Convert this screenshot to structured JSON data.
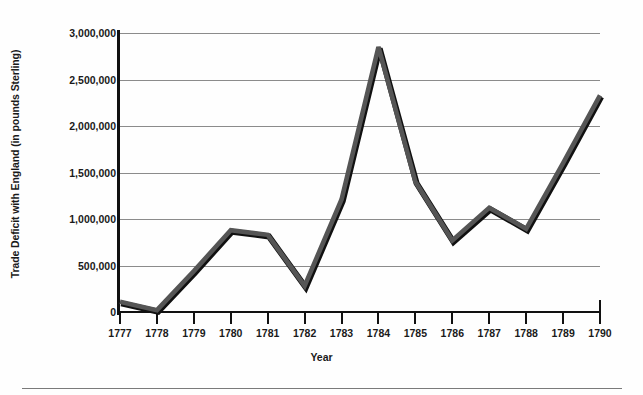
{
  "chart_data": {
    "type": "line",
    "title": "",
    "xlabel": "Year",
    "ylabel": "Trade Deficit with England (in pounds Sterling)",
    "x": [
      1777,
      1778,
      1779,
      1780,
      1781,
      1782,
      1783,
      1784,
      1785,
      1786,
      1787,
      1788,
      1789,
      1790
    ],
    "categories": [
      "1777",
      "1778",
      "1779",
      "1780",
      "1781",
      "1782",
      "1783",
      "1784",
      "1785",
      "1786",
      "1787",
      "1788",
      "1789",
      "1790"
    ],
    "values": [
      110000,
      20000,
      440000,
      880000,
      830000,
      280000,
      1210000,
      2850000,
      1400000,
      770000,
      1120000,
      895000,
      1600000,
      2330000
    ],
    "series": [
      {
        "name": "Trade Deficit with England",
        "values": [
          110000,
          20000,
          440000,
          880000,
          830000,
          280000,
          1210000,
          2850000,
          1400000,
          770000,
          1120000,
          895000,
          1600000,
          2330000
        ]
      }
    ],
    "ylim": [
      0,
      3000000
    ],
    "xlim": [
      1777,
      1790
    ],
    "ytick_labels": [
      "0",
      "500,000",
      "1,000,000",
      "1,500,000",
      "2,000,000",
      "2,500,000",
      "3,000,000"
    ],
    "ytick_values": [
      0,
      500000,
      1000000,
      1500000,
      2000000,
      2500000,
      3000000
    ],
    "grid": "horizontal",
    "legend": "none",
    "line_color": "#555555",
    "line_shadow_color": "#111111",
    "grid_color": "#8b8b8b",
    "axis_color": "#111111",
    "background_color": "#fefefe"
  }
}
